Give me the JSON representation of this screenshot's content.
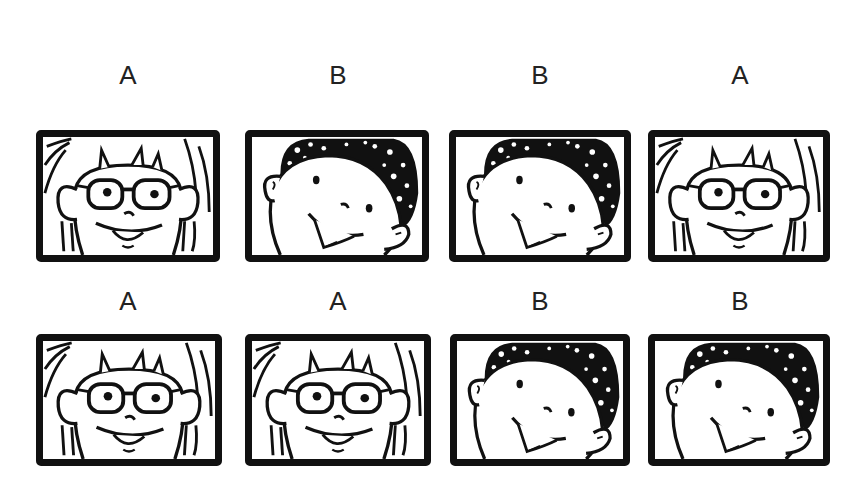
{
  "rows": [
    {
      "cards": [
        {
          "label": "A",
          "face": "girl-with-glasses"
        },
        {
          "label": "B",
          "face": "curly-haired-boy"
        },
        {
          "label": "B",
          "face": "curly-haired-boy"
        },
        {
          "label": "A",
          "face": "girl-with-glasses"
        }
      ]
    },
    {
      "cards": [
        {
          "label": "A",
          "face": "girl-with-glasses"
        },
        {
          "label": "A",
          "face": "girl-with-glasses"
        },
        {
          "label": "B",
          "face": "curly-haired-boy"
        },
        {
          "label": "B",
          "face": "curly-haired-boy"
        }
      ]
    }
  ],
  "colors": {
    "ink": "#111111",
    "background": "#ffffff"
  }
}
